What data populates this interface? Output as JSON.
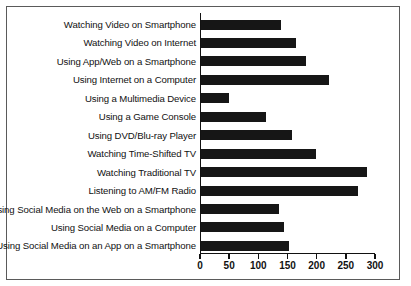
{
  "chart_data": {
    "type": "bar",
    "orientation": "horizontal",
    "title": "",
    "subtitle": "",
    "xlabel": "",
    "ylabel": "",
    "xlim": [
      0,
      300
    ],
    "ticks": [
      0,
      50,
      100,
      150,
      200,
      250,
      300
    ],
    "grid": false,
    "legend": null,
    "bar_color": "#161616",
    "frame_color": "#5a5a5a",
    "axis_color": "#111111",
    "background": "#ffffff",
    "categories": [
      "Watching Video on Smartphone",
      "Watching Video on Internet",
      "Using App/Web on a Smartphone",
      "Using Internet on a Computer",
      "Using a Multimedia Device",
      "Using a Game Console",
      "Using DVD/Blu-ray Player",
      "Watching Time-Shifted TV",
      "Watching Traditional TV",
      "Listening to AM/FM Radio",
      "Using Social Media on the Web on a Smartphone",
      "Using Social Media on a Computer",
      "Using Social Media on an App on a Smartphone"
    ],
    "values": [
      137,
      163,
      180,
      220,
      48,
      112,
      156,
      197,
      285,
      269,
      133,
      142,
      151
    ]
  }
}
